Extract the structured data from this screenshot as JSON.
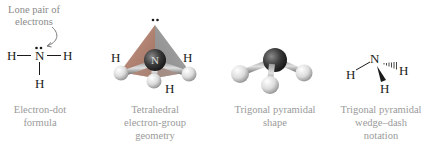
{
  "panels": [
    {
      "id": "electron-dot",
      "annotation": "Lone pair of\nelectrons",
      "atoms": {
        "center": "N",
        "left": "H",
        "right": "H",
        "bottom": "H"
      },
      "caption": "Electron-dot\nformula"
    },
    {
      "id": "tetrahedral",
      "atoms": {
        "center": "N",
        "left": "H",
        "right": "H",
        "bottom": "H"
      },
      "caption": "Tetrahedral\nelectron-group\ngeometry"
    },
    {
      "id": "trigonal-shape",
      "caption": "Trigonal pyramidal\nshape"
    },
    {
      "id": "wedge-dash",
      "atoms": {
        "center": "N",
        "left": "H",
        "right": "H",
        "bottom": "H"
      },
      "caption": "Trigonal pyramidal\nwedge–dash\nnotation"
    }
  ],
  "colors": {
    "caption": "#9a9a9a",
    "tetrahedron": "#b07a6a",
    "nitrogen": "#3c3c3c",
    "hydrogen": "#e6e6e6",
    "bond": "#555555"
  }
}
